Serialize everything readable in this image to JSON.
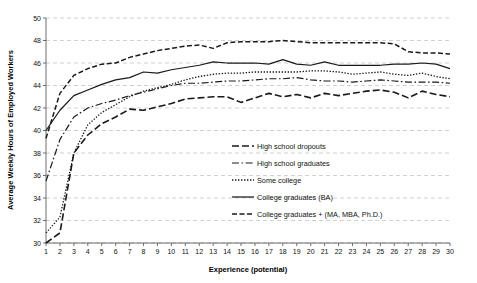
{
  "chart_data": {
    "type": "line",
    "title": "",
    "xlabel": "Experience (potential)",
    "ylabel": "Average Weekly Hours of Employed Workers",
    "xlim": [
      1,
      30
    ],
    "ylim": [
      30,
      50
    ],
    "ytick_step": 2,
    "grid": true,
    "legend_position": "inside-bottom-right",
    "x": [
      1,
      2,
      3,
      4,
      5,
      6,
      7,
      8,
      9,
      10,
      11,
      12,
      13,
      14,
      15,
      16,
      17,
      18,
      19,
      20,
      21,
      22,
      23,
      24,
      25,
      26,
      27,
      28,
      29,
      30
    ],
    "xticklabels": [
      "1",
      "2",
      "3",
      "4",
      "5",
      "6",
      "7",
      "8",
      "9",
      "10",
      "11",
      "12",
      "13",
      "14",
      "15",
      "16",
      "17",
      "18",
      "19",
      "20",
      "21",
      "22",
      "23",
      "24",
      "25",
      "26",
      "27",
      "28",
      "29",
      "30"
    ],
    "yticklabels": [
      "30",
      "32",
      "34",
      "36",
      "38",
      "40",
      "42",
      "44",
      "46",
      "48",
      "50"
    ],
    "series": [
      {
        "name": "High school dropouts",
        "linestyle": "long-dash",
        "dasharray": "7 3",
        "linewidth": 1.6,
        "values": [
          30.0,
          30.9,
          38.0,
          39.6,
          40.6,
          41.2,
          41.9,
          41.8,
          42.1,
          42.4,
          42.8,
          42.9,
          43.0,
          43.0,
          42.5,
          42.9,
          43.3,
          43.0,
          43.2,
          42.9,
          43.3,
          43.1,
          43.3,
          43.5,
          43.6,
          43.4,
          42.9,
          43.5,
          43.2,
          43.0
        ]
      },
      {
        "name": "High school graduates",
        "linestyle": "dash-dot",
        "dasharray": "7 2.5 1.6 2.5",
        "linewidth": 1.2,
        "values": [
          35.5,
          39.2,
          41.2,
          42.0,
          42.4,
          42.7,
          43.1,
          43.4,
          43.7,
          44.0,
          44.2,
          44.2,
          44.3,
          44.4,
          44.4,
          44.5,
          44.6,
          44.6,
          44.7,
          44.5,
          44.4,
          44.4,
          44.3,
          44.4,
          44.5,
          44.4,
          44.3,
          44.3,
          44.3,
          44.2
        ]
      },
      {
        "name": "Some college",
        "linestyle": "dotted",
        "dasharray": "1.4 1.6",
        "linewidth": 1.3,
        "values": [
          30.9,
          32.3,
          38.0,
          40.5,
          41.6,
          42.3,
          43.0,
          43.5,
          43.8,
          44.1,
          44.5,
          44.8,
          45.0,
          45.1,
          45.1,
          45.2,
          45.2,
          45.2,
          45.2,
          45.3,
          45.3,
          45.2,
          45.0,
          45.1,
          45.2,
          45.0,
          44.9,
          45.1,
          44.8,
          44.6
        ]
      },
      {
        "name": "College graduates (BA)",
        "linestyle": "solid",
        "dasharray": "none",
        "linewidth": 1.25,
        "values": [
          40.0,
          41.8,
          43.1,
          43.6,
          44.1,
          44.5,
          44.7,
          45.2,
          45.1,
          45.4,
          45.6,
          45.8,
          46.1,
          46.0,
          46.0,
          46.0,
          45.9,
          46.3,
          45.9,
          45.8,
          46.1,
          45.8,
          45.8,
          45.8,
          45.8,
          45.9,
          45.9,
          46.0,
          45.9,
          45.5
        ]
      },
      {
        "name": "College graduates + (MA, MBA, Ph.D.)",
        "linestyle": "dashed",
        "dasharray": "5 2.5",
        "linewidth": 1.5,
        "values": [
          39.3,
          43.3,
          44.9,
          45.5,
          45.9,
          46.0,
          46.5,
          46.8,
          47.1,
          47.3,
          47.5,
          47.6,
          47.3,
          47.8,
          47.9,
          47.9,
          47.9,
          48.0,
          47.9,
          47.8,
          47.8,
          47.8,
          47.8,
          47.8,
          47.8,
          47.7,
          47.0,
          46.9,
          46.9,
          46.8
        ]
      }
    ],
    "legend": [
      {
        "label": "High school dropouts",
        "dasharray": "7 3",
        "linewidth": 1.6
      },
      {
        "label": "High school graduates",
        "dasharray": "7 2.5 1.6 2.5",
        "linewidth": 1.2
      },
      {
        "label": "Some college",
        "dasharray": "1.4 1.6",
        "linewidth": 1.3
      },
      {
        "label": "College graduates (BA)",
        "dasharray": "none",
        "linewidth": 1.25
      },
      {
        "label": "College graduates + (MA, MBA, Ph.D.)",
        "dasharray": "5 2.5",
        "linewidth": 1.5
      }
    ],
    "colors": {
      "series_stroke": "#1a1a1a",
      "grid": "#bdbdbd",
      "axis": "#4a4a4a",
      "text": "#111111",
      "background": "#ffffff"
    }
  }
}
